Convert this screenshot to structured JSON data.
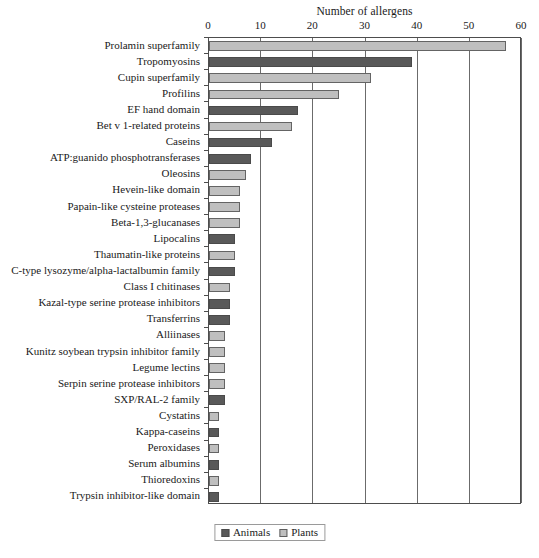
{
  "chart_data": {
    "type": "bar",
    "orientation": "horizontal",
    "title": "Number of allergens",
    "xlabel": "Number of allergens",
    "ylabel": "",
    "xlim": [
      0,
      60
    ],
    "xticks": [
      0,
      10,
      20,
      30,
      40,
      50,
      60
    ],
    "grid": true,
    "legend_position": "bottom",
    "legend": [
      "Animals",
      "Plants"
    ],
    "colors": {
      "animals": "#595959",
      "plants": "#bfbfbf"
    },
    "categories": [
      "Prolamin superfamily",
      "Tropomyosins",
      "Cupin superfamily",
      "Profilins",
      "EF hand domain",
      "Bet v 1-related proteins",
      "Caseins",
      "ATP:guanido phosphotransferases",
      "Oleosins",
      "Hevein-like domain",
      "Papain-like cysteine proteases",
      "Beta-1,3-glucanases",
      "Lipocalins",
      "Thaumatin-like proteins",
      "C-type lysozyme/alpha-lactalbumin family",
      "Class I chitinases",
      "Kazal-type serine protease inhibitors",
      "Transferrins",
      "Alliinases",
      "Kunitz soybean trypsin inhibitor family",
      "Legume lectins",
      "Serpin serine protease inhibitors",
      "SXP/RAL-2 family",
      "Cystatins",
      "Kappa-caseins",
      "Peroxidases",
      "Serum albumins",
      "Thioredoxins",
      "Trypsin inhibitor-like domain"
    ],
    "values": [
      57,
      39,
      31,
      25,
      17,
      16,
      12,
      8,
      7,
      6,
      6,
      6,
      5,
      5,
      5,
      4,
      4,
      4,
      3,
      3,
      3,
      3,
      3,
      2,
      2,
      2,
      2,
      2,
      2
    ],
    "groups": [
      "Plants",
      "Animals",
      "Plants",
      "Plants",
      "Animals",
      "Plants",
      "Animals",
      "Animals",
      "Plants",
      "Plants",
      "Plants",
      "Plants",
      "Animals",
      "Plants",
      "Animals",
      "Plants",
      "Animals",
      "Animals",
      "Plants",
      "Plants",
      "Plants",
      "Plants",
      "Animals",
      "Plants",
      "Animals",
      "Plants",
      "Animals",
      "Plants",
      "Animals"
    ]
  }
}
